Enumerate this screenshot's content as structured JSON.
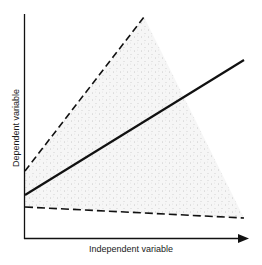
{
  "diagram": {
    "x_axis_label": "Independent variable",
    "y_axis_label": "Dependent variable",
    "colors": {
      "line": "#111111",
      "stipple_bg": "#f6f6f6",
      "stipple_dot": "#9a9a9a"
    },
    "elements": [
      {
        "name": "upper-bound",
        "style": "dashed",
        "from": [
          25,
          171
        ],
        "to": [
          144,
          17
        ]
      },
      {
        "name": "regression-line",
        "style": "solid",
        "from": [
          25,
          195
        ],
        "to": [
          244,
          60
        ]
      },
      {
        "name": "lower-bound",
        "style": "dashed",
        "from": [
          25,
          207
        ],
        "to": [
          244,
          218
        ]
      },
      {
        "name": "confidence-region",
        "style": "stippled",
        "polygon": [
          [
            25,
            171
          ],
          [
            144,
            17
          ],
          [
            244,
            218
          ],
          [
            25,
            207
          ]
        ]
      }
    ]
  }
}
